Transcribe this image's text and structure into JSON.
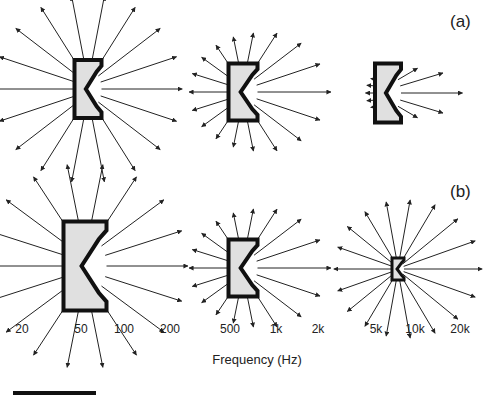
{
  "figure": {
    "panel_labels": [
      {
        "id": "a",
        "text": "(a)",
        "x": 450,
        "y": 12
      },
      {
        "id": "b",
        "text": "(b)",
        "x": 450,
        "y": 182
      }
    ],
    "x_axis": {
      "label": "Frequency (Hz)",
      "label_x": 257,
      "label_y": 352,
      "ticks": [
        {
          "text": "20",
          "x": 22
        },
        {
          "text": "50",
          "x": 81
        },
        {
          "text": "100",
          "x": 124
        },
        {
          "text": "200",
          "x": 170
        },
        {
          "text": "500",
          "x": 230
        },
        {
          "text": "1k",
          "x": 276
        },
        {
          "text": "2k",
          "x": 318
        },
        {
          "text": "5k",
          "x": 376
        },
        {
          "text": "10k",
          "x": 415
        },
        {
          "text": "20k",
          "x": 460
        }
      ],
      "tick_y": 322
    },
    "colors": {
      "cabinet_fill": "#e0e0e0",
      "cabinet_stroke": "#111111",
      "arrow": "#222222"
    },
    "speakers": [
      {
        "row": "a",
        "cx": 88,
        "cy": 89,
        "w": 27,
        "h": 58,
        "arrow_len": [
          78,
          78,
          78,
          78,
          78,
          78,
          78,
          78,
          78,
          78,
          78,
          78,
          78,
          78,
          78,
          78,
          78,
          78
        ],
        "note": "low frequency, omnidirectional"
      },
      {
        "row": "a",
        "cx": 243,
        "cy": 92,
        "w": 29,
        "h": 57,
        "arrow_len": [
          38,
          38,
          38,
          40,
          44,
          52,
          60,
          66,
          72,
          66,
          60,
          52,
          44,
          40,
          38,
          38,
          38,
          38
        ],
        "note": "mid frequency"
      },
      {
        "row": "a",
        "cx": 388,
        "cy": 93,
        "w": 26,
        "h": 59,
        "arrow_len": [
          6,
          6,
          6,
          6,
          6,
          8,
          22,
          42,
          58,
          42,
          22,
          8,
          6,
          6,
          6,
          6,
          6,
          6
        ],
        "note": "high frequency, directional"
      },
      {
        "row": "b",
        "cx": 85,
        "cy": 266,
        "w": 43,
        "h": 89,
        "arrow_len": [
          78,
          78,
          78,
          78,
          78,
          78,
          78,
          78,
          78,
          78,
          78,
          78,
          78,
          78,
          78,
          78,
          78,
          78
        ],
        "note": "large cabinet"
      },
      {
        "row": "b",
        "cx": 243,
        "cy": 268,
        "w": 29,
        "h": 57,
        "arrow_len": [
          38,
          38,
          38,
          40,
          44,
          52,
          60,
          66,
          72,
          66,
          60,
          52,
          44,
          40,
          38,
          38,
          38,
          38
        ],
        "note": "medium cabinet"
      },
      {
        "row": "b",
        "cx": 398,
        "cy": 269,
        "w": 12,
        "h": 22,
        "arrow_len": [
          58,
          60,
          60,
          62,
          64,
          68,
          72,
          76,
          78,
          76,
          72,
          68,
          64,
          62,
          60,
          60,
          58,
          58
        ],
        "note": "small cabinet"
      }
    ]
  }
}
